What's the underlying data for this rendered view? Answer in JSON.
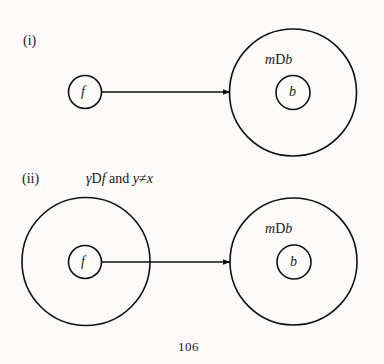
{
  "figure": {
    "part_i": {
      "label": "(i)",
      "source_node": {
        "label": "f"
      },
      "target_region": {
        "label_var": "m",
        "label_rel": "D",
        "label_obj": "b"
      },
      "target_node": {
        "label": "b"
      }
    },
    "part_ii": {
      "label": "(ii)",
      "condition": {
        "var1": "γ",
        "rel": "D",
        "obj": "f",
        "conj": " and ",
        "var2": "y",
        "neq": "≠",
        "var3": "x"
      },
      "source_region": {},
      "source_node": {
        "label": "f"
      },
      "target_region": {
        "label_var": "m",
        "label_rel": "D",
        "label_obj": "b"
      },
      "target_node": {
        "label": "b"
      }
    }
  },
  "page_number": "106",
  "colors": {
    "stroke": "#111111",
    "background": "#fbfaf8"
  }
}
